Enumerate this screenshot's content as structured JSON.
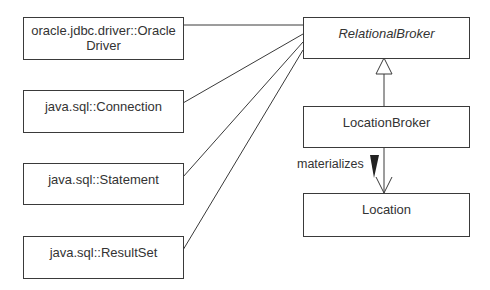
{
  "diagram": {
    "type": "UML class diagram",
    "classes": [
      {
        "id": "oracle_driver",
        "name": "oracle.jdbc.driver::Oracle Driver",
        "line1": "oracle.jdbc.driver::Oracle",
        "line2": "Driver"
      },
      {
        "id": "connection",
        "name": "java.sql::Connection"
      },
      {
        "id": "statement",
        "name": "java.sql::Statement"
      },
      {
        "id": "resultset",
        "name": "java.sql::ResultSet"
      },
      {
        "id": "relational_broker",
        "name": "RelationalBroker",
        "abstract": true
      },
      {
        "id": "location_broker",
        "name": "LocationBroker"
      },
      {
        "id": "location",
        "name": "Location"
      }
    ],
    "relationships": [
      {
        "from": "relational_broker",
        "to": "oracle_driver",
        "type": "association"
      },
      {
        "from": "relational_broker",
        "to": "connection",
        "type": "association"
      },
      {
        "from": "relational_broker",
        "to": "statement",
        "type": "association"
      },
      {
        "from": "relational_broker",
        "to": "resultset",
        "type": "association"
      },
      {
        "from": "location_broker",
        "to": "relational_broker",
        "type": "generalization"
      },
      {
        "from": "location_broker",
        "to": "location",
        "type": "directed-association",
        "label": "materializes"
      }
    ],
    "association_label": "materializes"
  }
}
